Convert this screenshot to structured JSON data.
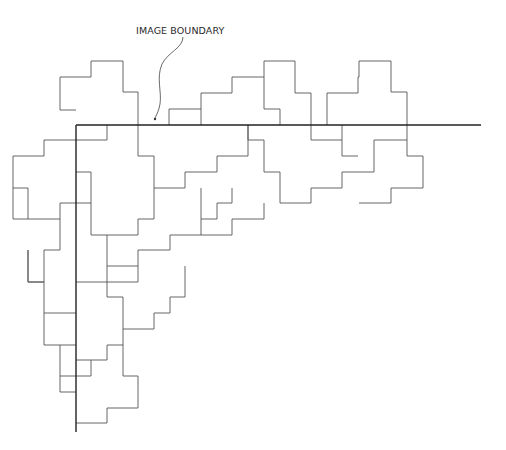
{
  "label": {
    "text": "IMAGE BOUNDARY"
  },
  "colors": {
    "background": "#ffffff",
    "tile_stroke": "#555555",
    "boundary_stroke": "#222222"
  },
  "boundary": {
    "horizontal": {
      "x1": 76,
      "y1": 125,
      "x2": 481,
      "y2": 125
    },
    "vertical": {
      "x1": 76,
      "y1": 125,
      "x2": 76,
      "y2": 432
    }
  },
  "arrow": {
    "path": "M183,37 C183,48 168,52 162,64 C156,78 162,92 160,104 C159,110 157,114 155,118",
    "tip": {
      "cx": 155,
      "cy": 119,
      "r": 1.2
    }
  },
  "tile_segments": [
    "M60,110 L60,77 L91,77 L91,61 L123,61 L123,92 L138,92 L138,125",
    "M60,110 L76,110",
    "M169,125 L169,109 L201,109 L201,93 L232,93 L232,77 L264,77 L264,61 L295,61 L295,93 L311,93 L311,125",
    "M201,109 L201,125",
    "M264,77 L264,109 L280,109 L280,125",
    "M327,125 L327,93 L358,93 L358,77 L359,77 L359,61 L391,61 L391,92 L407,92 L407,156 L423,156 L423,188 L391,188 L391,203 L359,203",
    "M76,140 L107,140 L107,125",
    "M76,140 L44,140 L44,156 L13,156 L13,188 L28,188 L28,219 L60,219 L60,203 L76,203",
    "M138,125 L138,156 L154,156 L154,188 L185,188 L185,172 L217,172 L217,156 L248,156 L248,125",
    "M248,125 L248,140 L264,140 L264,172 L280,172 L280,203 L311,203 L311,188 L342,188 L342,172 L374,172 L374,140 L407,140",
    "M311,125 L311,140 L342,140 L342,156 L358,156 L358,156",
    "M342,125 L342,140",
    "M76,172 L91,172 L91,235 L107,235 L107,266 L138,266 L138,250 L170,250 L170,235 L201,235 L201,219 L217,219 L217,203 L232,203 L232,188",
    "M154,188 L154,219 L138,219 L138,235 L107,235",
    "M76,203 L91,203",
    "M201,188 L201,219",
    "M264,203 L264,219 L232,219 L232,235 L217,235",
    "M201,235 L217,235",
    "M60,219 L60,250 L44,250 L44,282 L28,282 L28,250",
    "M13,188 L13,219 L28,219",
    "M28,250 L28,282 L44,282",
    "M76,282 L138,282 L138,266",
    "M107,266 L107,297 L123,297 L123,329 L154,329 L154,313 L170,313 L170,297 L185,297 L185,266",
    "M44,282 L44,313 L76,313",
    "M44,313 L44,345 L60,345 L60,376 L91,376 L91,360 L107,360 L107,345 L123,345 L123,329",
    "M60,345 L76,345",
    "M123,345 L123,376 L138,376 L138,408 L107,408 L107,423 L76,423",
    "M91,360 L76,360",
    "M60,376 L60,392 L76,392"
  ]
}
